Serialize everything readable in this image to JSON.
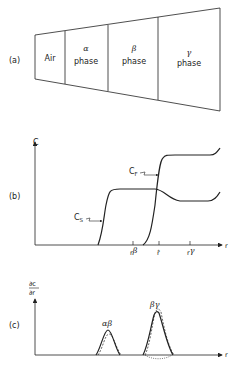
{
  "panel_a": {
    "label": "(a)",
    "regions": [
      {
        "line1": "Air",
        "line2": ""
      },
      {
        "line1": "α",
        "line2": "phase"
      },
      {
        "line1": "β",
        "line2": "phase"
      },
      {
        "line1": "γ",
        "line2": "phase"
      }
    ]
  },
  "panel_b": {
    "label": "(b)",
    "y_axis": "C",
    "x_axis": "r",
    "curve_labels": {
      "cs": "C",
      "cs_sub": "S",
      "cf": "C",
      "cf_sub": "F"
    },
    "ticks": [
      {
        "base": "r",
        "sup": "β"
      },
      {
        "base": "r̂",
        "sup": ""
      },
      {
        "base": "r",
        "sup": "γ"
      }
    ]
  },
  "panel_c": {
    "label": "(c)",
    "y_axis_num": "∂c",
    "y_axis_den": "∂r",
    "x_axis": "r",
    "peaks": [
      {
        "label": "αβ"
      },
      {
        "label": "βγ"
      }
    ]
  }
}
